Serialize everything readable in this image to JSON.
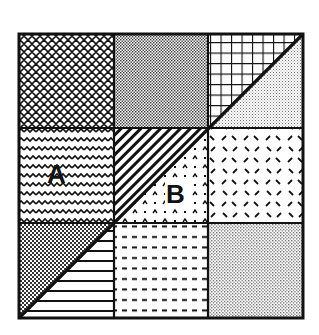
{
  "diagram": {
    "type": "quilt-block-area-puzzle",
    "grid": {
      "rows": 3,
      "cols": 3
    },
    "outer_square": {
      "x": 19,
      "y": 34,
      "size": 284
    },
    "main_diagonal": "from bottom-left corner to top-right corner",
    "colors": {
      "ink": "#111111",
      "background": "#ffffff"
    },
    "cells": [
      {
        "row": 0,
        "col": 0,
        "fill": "diamond-crosshatch"
      },
      {
        "row": 0,
        "col": 1,
        "fill": "fine-dots-dense"
      },
      {
        "row": 0,
        "col": 2,
        "upper_left": "square-grid",
        "lower_right": "fine-dots-light"
      },
      {
        "row": 1,
        "col": 0,
        "fill": "wavy-lines",
        "label": "A"
      },
      {
        "row": 1,
        "col": 1,
        "upper_left": "diagonal-stripes",
        "lower_right": "carets-and-dots",
        "label": "B"
      },
      {
        "row": 1,
        "col": 2,
        "fill": "scattered-dashes"
      },
      {
        "row": 2,
        "col": 0,
        "upper_left": "checker-dots",
        "lower_right": "horizontal-lines"
      },
      {
        "row": 2,
        "col": 1,
        "fill": "dashed-rows"
      },
      {
        "row": 2,
        "col": 2,
        "fill": "fine-dots-medium"
      }
    ],
    "labels": {
      "A": "A",
      "B": "B"
    }
  }
}
